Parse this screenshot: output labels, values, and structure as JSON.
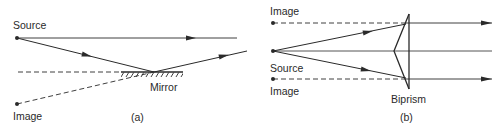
{
  "panel_a": {
    "caption": "(a)",
    "labels": {
      "source": "Source",
      "image": "Image",
      "mirror": "Mirror"
    }
  },
  "panel_b": {
    "caption": "(b)",
    "labels": {
      "image_top": "Image",
      "source": "Source",
      "image_bottom": "Image",
      "biprism": "Biprism"
    }
  },
  "colors": {
    "ink": "#2a2a2a",
    "background": "#ffffff"
  }
}
